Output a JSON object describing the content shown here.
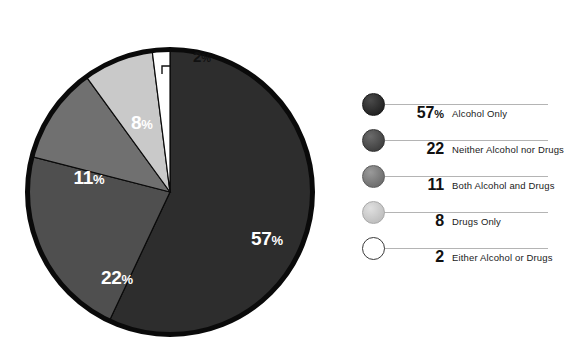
{
  "chart_data": {
    "type": "pie",
    "title": "",
    "subtitle": "",
    "xlabel": "",
    "ylabel": "",
    "grid": false,
    "legend_position": "right",
    "start_angle_deg": 0,
    "direction": "clockwise",
    "units": "percent",
    "categories": [
      "Alcohol Only",
      "Neither Alcohol nor Drugs",
      "Both Alcohol and Drugs",
      "Drugs Only",
      "Either Alcohol or Drugs"
    ],
    "values": [
      57,
      22,
      11,
      8,
      2
    ],
    "colors": [
      "#2d2d2d",
      "#4f4f4f",
      "#707070",
      "#c9c9c9",
      "#ffffff"
    ],
    "slice_labels": [
      "57%",
      "22%",
      "11%",
      "8%",
      "2%"
    ],
    "annotations": [
      {
        "text": "2%",
        "note": "callout with leader line above the white slice"
      }
    ]
  },
  "pie": {
    "outline_color": "#0a0a0a",
    "label_color": "#ffffff",
    "callout_color": "#111111",
    "slices": [
      {
        "id": "alcohol-only",
        "num": "57",
        "pct": "%",
        "value": 57,
        "color": "#2d2d2d",
        "label_x": 243,
        "label_y": 201,
        "label_anchor": "middle"
      },
      {
        "id": "neither-alcohol-nor-drugs",
        "num": "22",
        "pct": "%",
        "value": 22,
        "color": "#4f4f4f",
        "label_x": 93,
        "label_y": 240,
        "label_anchor": "middle"
      },
      {
        "id": "both-alcohol-and-drugs",
        "num": "11",
        "pct": "%",
        "value": 11,
        "color": "#707070",
        "label_x": 65,
        "label_y": 140,
        "label_anchor": "middle"
      },
      {
        "id": "drugs-only",
        "num": "8",
        "pct": "%",
        "value": 8,
        "color": "#c9c9c9",
        "label_x": 118,
        "label_y": 85,
        "label_anchor": "middle"
      },
      {
        "id": "either-alcohol-or-drugs",
        "num": "2",
        "pct": "%",
        "value": 2,
        "color": "#ffffff",
        "label_x": 169,
        "label_y": 18,
        "label_anchor": "start"
      }
    ]
  },
  "legend": {
    "rows": [
      {
        "id": "alcohol-only",
        "swatch": "dark-circle-swatch",
        "value": "57",
        "pct": "%",
        "label": "Alcohol Only",
        "fill_from": "#4a4a4a",
        "fill_to": "#1f1f1f",
        "border": "#1a1a1a"
      },
      {
        "id": "neither-alcohol-nor-drugs",
        "swatch": "dark-gray-circle-swatch",
        "value": "22",
        "pct": "",
        "label": "Neither Alcohol nor Drugs",
        "fill_from": "#6b6b6b",
        "fill_to": "#3c3c3c",
        "border": "#333333"
      },
      {
        "id": "both-alcohol-and-drugs",
        "swatch": "mid-gray-circle-swatch",
        "value": "11",
        "pct": "",
        "label": "Both Alcohol and Drugs",
        "fill_from": "#9a9a9a",
        "fill_to": "#6a6a6a",
        "border": "#5c5c5c"
      },
      {
        "id": "drugs-only",
        "swatch": "light-gray-circle-swatch",
        "value": "8",
        "pct": "",
        "label": "Drugs Only",
        "fill_from": "#e0e0e0",
        "fill_to": "#bcbcbc",
        "border": "#a8a8a8"
      },
      {
        "id": "either-alcohol-or-drugs",
        "swatch": "white-circle-swatch",
        "value": "2",
        "pct": "",
        "label": "Either Alcohol or Drugs",
        "fill_from": "#ffffff",
        "fill_to": "#ffffff",
        "border": "#3a3a3a"
      }
    ],
    "rule_color": "#b4b4b4"
  }
}
